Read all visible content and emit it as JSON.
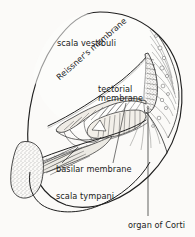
{
  "figure": {
    "kind": "anatomical-diagram",
    "width": 195,
    "height": 237,
    "background_color": "#fbfaf8",
    "ink_color": "#1a1a1a",
    "line_color": "#262626"
  },
  "labels": {
    "scala_vestibuli": "scala vestibuli",
    "reissners_membrane": "Reissner's membrane",
    "tectorial_membrane_line1": "tectorial",
    "tectorial_membrane_line2": "membrane",
    "basilar_membrane": "basilar membrane",
    "scala_tympani": "scala tympani",
    "organ_of_corti": "organ of Corti"
  },
  "structures": [
    {
      "name": "cochlear-duct-outline",
      "description": "outer oval boundary of the cochlear turn"
    },
    {
      "name": "scala-vestibuli-chamber",
      "description": "upper fluid chamber above Reissner's membrane"
    },
    {
      "name": "reissners-membrane-line",
      "description": "thin diagonal membrane separating scala vestibuli from scala media"
    },
    {
      "name": "scala-media-chamber",
      "description": "triangular middle duct"
    },
    {
      "name": "stria-vascularis",
      "description": "stippled vascular strip along right lateral wall"
    },
    {
      "name": "spiral-ligament",
      "description": "fibrous wedge at right lateral wall"
    },
    {
      "name": "tectorial-membrane-shape",
      "description": "striated flap overhanging the hair cells"
    },
    {
      "name": "organ-of-corti-cells",
      "description": "hair cells and supporting cells on basilar membrane"
    },
    {
      "name": "basilar-membrane-line",
      "description": "membrane forming floor of scala media"
    },
    {
      "name": "scala-tympani-chamber",
      "description": "lower fluid chamber below basilar membrane"
    },
    {
      "name": "modiolus-bone",
      "description": "stippled bony core at left"
    },
    {
      "name": "spiral-ganglion-nerve",
      "description": "nerve fiber bundle entering from the modiolus"
    }
  ],
  "leader_lines": [
    {
      "name": "tectorial-membrane-leader",
      "from_label": "tectorial membrane",
      "to_structure": "tectorial-membrane-shape"
    },
    {
      "name": "basilar-membrane-leader",
      "from_label": "basilar membrane",
      "to_structure": "basilar-membrane-line"
    },
    {
      "name": "organ-of-corti-leader",
      "from_label": "organ of Corti",
      "to_structure": "organ-of-corti-cells"
    }
  ]
}
